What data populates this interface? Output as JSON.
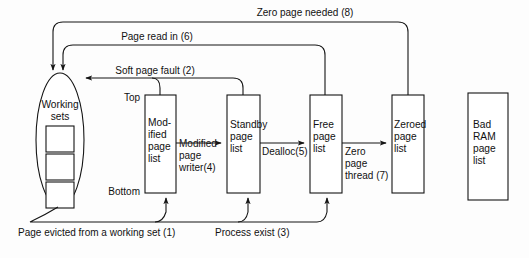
{
  "diagram": {
    "title_alt": "Windows page frame state transition diagram",
    "background_color": "#fdfdfd",
    "line_color": "#141414",
    "text_color": "#111111",
    "working_sets": {
      "label_line1": "Working",
      "label_line2": "sets",
      "square_count": 3
    },
    "side_labels": {
      "top": "Top",
      "bottom": "Bottom"
    },
    "boxes": [
      {
        "id": "modified-page-list",
        "lines": [
          "Mod-",
          "ified",
          "page",
          "list"
        ],
        "x": 145,
        "y": 95,
        "w": 31,
        "h": 98
      },
      {
        "id": "standby-page-list",
        "lines": [
          "Standby",
          "page",
          "list"
        ],
        "x": 227,
        "y": 95,
        "w": 33,
        "h": 98
      },
      {
        "id": "free-page-list",
        "lines": [
          "Free",
          "page",
          "list"
        ],
        "x": 310,
        "y": 95,
        "w": 32,
        "h": 98
      },
      {
        "id": "zeroed-page-list",
        "lines": [
          "Zeroed",
          "page",
          "list"
        ],
        "x": 392,
        "y": 95,
        "w": 32,
        "h": 98
      },
      {
        "id": "bad-ram-page-list",
        "lines": [
          "Bad",
          "RAM",
          "page",
          "list"
        ],
        "x": 468,
        "y": 93,
        "w": 40,
        "h": 107
      }
    ],
    "edges": [
      {
        "id": "zero-page-needed",
        "label": "Zero page needed (8)",
        "step": 8
      },
      {
        "id": "page-read-in",
        "label": "Page read in (6)",
        "step": 6
      },
      {
        "id": "soft-page-fault",
        "label": "Soft page fault (2)",
        "step": 2
      },
      {
        "id": "modified-page-writer",
        "label_lines": [
          "Modified",
          "page",
          "writer(4)"
        ],
        "step": 4
      },
      {
        "id": "dealloc",
        "label": "Dealloc(5)",
        "step": 5
      },
      {
        "id": "zero-page-thread",
        "label_lines": [
          "Zero",
          "page",
          "thread (7)"
        ],
        "step": 7
      },
      {
        "id": "page-evicted",
        "label": "Page evicted from a working set (1)",
        "step": 1
      },
      {
        "id": "process-exist",
        "label": "Process exist (3)",
        "step": 3
      }
    ]
  }
}
